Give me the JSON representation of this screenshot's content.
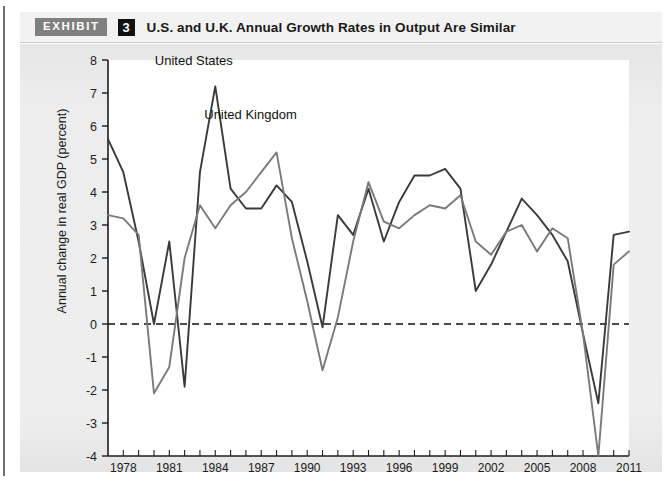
{
  "header": {
    "tag": "EXHIBIT",
    "number": "3",
    "title": "U.S. and U.K. Annual Growth Rates in Output Are Similar"
  },
  "colors": {
    "united_states_line": "#3a3a3a",
    "united_kingdom_line": "#7a7a7a",
    "panel_background": "#eaeaea",
    "plot_background": "#ffffff",
    "axis": "#1c1c1c",
    "exhibit_tag_background": "#808080",
    "exhibit_number_background": "#111111"
  },
  "chart_data": {
    "type": "line",
    "title": "U.S. and U.K. Annual Growth Rates in Output Are Similar",
    "xlabel": "",
    "ylabel": "Annual change in real GDP (percent)",
    "ylim": [
      -4,
      8
    ],
    "xlim": [
      1977,
      2011
    ],
    "yticks": [
      8,
      7,
      6,
      5,
      4,
      3,
      2,
      1,
      0,
      -1,
      -2,
      -3,
      -4
    ],
    "ytick_labels": [
      "8",
      "7",
      "6",
      "5",
      "4",
      "3",
      "2",
      "1",
      "0",
      "-1",
      "-2",
      "-3",
      "-4"
    ],
    "xticks": [
      1978,
      1981,
      1984,
      1987,
      1990,
      1993,
      1996,
      1999,
      2002,
      2005,
      2008,
      2011
    ],
    "xtick_labels": [
      "1978",
      "1981",
      "1984",
      "1987",
      "1990",
      "1993",
      "1996",
      "1999",
      "2002",
      "2005",
      "2008",
      "2011"
    ],
    "grid": false,
    "zero_line": true,
    "zero_line_style": "dashed",
    "legend_position": "inline-annotation",
    "x": [
      1977,
      1978,
      1979,
      1980,
      1981,
      1982,
      1983,
      1984,
      1985,
      1986,
      1987,
      1988,
      1989,
      1990,
      1991,
      1992,
      1993,
      1994,
      1995,
      1996,
      1997,
      1998,
      1999,
      2000,
      2001,
      2002,
      2003,
      2004,
      2005,
      2006,
      2007,
      2008,
      2009,
      2010,
      2011
    ],
    "series": [
      {
        "name": "United States",
        "color": "#3a3a3a",
        "values": [
          5.6,
          4.6,
          2.5,
          0.0,
          2.5,
          -1.9,
          4.6,
          7.2,
          4.1,
          3.5,
          3.5,
          4.2,
          3.7,
          1.9,
          -0.1,
          3.3,
          2.7,
          4.1,
          2.5,
          3.7,
          4.5,
          4.5,
          4.7,
          4.1,
          1.0,
          1.8,
          2.8,
          3.8,
          3.3,
          2.7,
          1.9,
          -0.3,
          -2.4,
          2.7,
          2.8
        ]
      },
      {
        "name": "United Kingdom",
        "color": "#7a7a7a",
        "values": [
          3.3,
          3.2,
          2.7,
          -2.1,
          -1.3,
          2.0,
          3.6,
          2.9,
          3.6,
          4.0,
          4.6,
          5.2,
          2.6,
          0.7,
          -1.4,
          0.2,
          2.5,
          4.3,
          3.1,
          2.9,
          3.3,
          3.6,
          3.5,
          3.9,
          2.5,
          2.1,
          2.8,
          3.0,
          2.2,
          2.9,
          2.6,
          -0.3,
          -4.0,
          1.8,
          2.2
        ]
      }
    ],
    "annotations": [
      {
        "text": "United States",
        "x": 1982.6,
        "y": 7.85,
        "series": "United States"
      },
      {
        "text": "United Kingdom",
        "x": 1986.3,
        "y": 6.2,
        "series": "United Kingdom"
      }
    ]
  }
}
